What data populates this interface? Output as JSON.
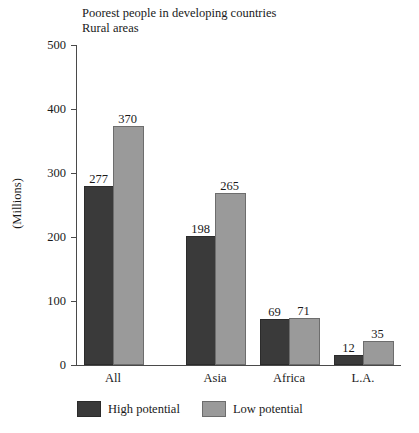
{
  "chart_data": {
    "type": "bar",
    "title": "Poorest people in developing countries",
    "subtitle": "Rural areas",
    "xlabel": "",
    "ylabel": "(Millions)",
    "ylim": [
      0,
      500
    ],
    "yticks": [
      0,
      100,
      200,
      300,
      400,
      500
    ],
    "ytick_labels": [
      "0",
      "100",
      "200",
      "300",
      "400",
      "500"
    ],
    "grid": false,
    "legend_position": "bottom",
    "categories": [
      "All",
      "Asia",
      "Africa",
      "L.A."
    ],
    "series": [
      {
        "name": "High potential",
        "color": "#3a3a3a",
        "values": [
          277,
          198,
          69,
          12
        ],
        "labels": [
          "277",
          "198",
          "69",
          "12"
        ]
      },
      {
        "name": "Low potential",
        "color": "#9a9a9a",
        "values": [
          370,
          265,
          71,
          35
        ],
        "labels": [
          "370",
          "265",
          "71",
          "35"
        ]
      }
    ]
  },
  "axis": {
    "line_color": "#4a4a4a"
  }
}
